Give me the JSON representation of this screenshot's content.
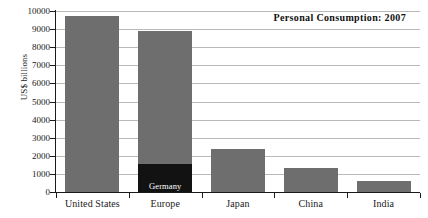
{
  "chart_data": {
    "type": "bar",
    "title": "Personal Consumption: 2007",
    "xlabel": "",
    "ylabel": "US$ billions",
    "ylim": [
      0,
      10000
    ],
    "ytick_labels": [
      "10000",
      "9000",
      "8000",
      "7000",
      "6000",
      "5000",
      "4000",
      "3000",
      "2000",
      "1000",
      "0"
    ],
    "ytick_values": [
      10000,
      9000,
      8000,
      7000,
      6000,
      5000,
      4000,
      3000,
      2000,
      1000,
      0
    ],
    "grid": true,
    "legend": "none",
    "categories": [
      "United States",
      "Europe",
      "Japan",
      "China",
      "India"
    ],
    "values": [
      9700,
      8900,
      2400,
      1300,
      600
    ],
    "series": [
      {
        "name": "Personal Consumption",
        "values": [
          9700,
          8900,
          2400,
          1300,
          600
        ]
      }
    ],
    "annotations": [
      {
        "label": "Germany",
        "category": "Europe",
        "value": 1550,
        "note": "dark sub-segment drawn at the base of the Europe bar"
      }
    ],
    "colors": {
      "bar": "#6e6e6e",
      "bar_sub": "#121212",
      "gridline": "#b9b9b9",
      "axis": "#1a1a1a",
      "background": "#ffffff",
      "sub_label_text": "#ffffff"
    }
  }
}
